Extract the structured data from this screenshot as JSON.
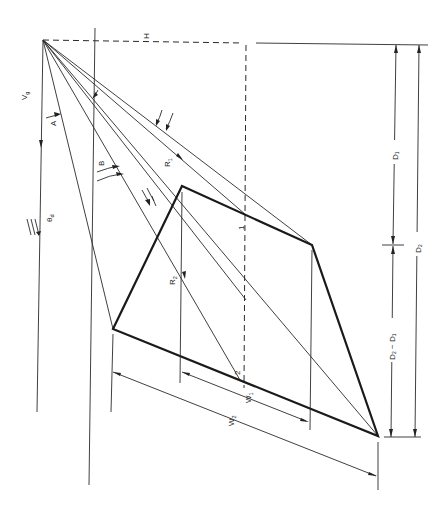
{
  "figure": {
    "orientation": "rotated 90 degrees clockwise",
    "labels": {
      "H": "H",
      "Vg_main": "V",
      "Vg_sub": "g",
      "A": "A",
      "B": "B",
      "theta_main": "θ",
      "theta_sub": "d",
      "R1_main": "R",
      "R1_sub": "1",
      "R2_main": "R",
      "R2_sub": "2",
      "point1": "1",
      "point2": "2",
      "W1_main": "W",
      "W1_sub": "1",
      "W2_main": "W",
      "W2_sub": "2",
      "D1": "D₁",
      "D2": "D₂",
      "D2_minus_D1": "D₂ − D₁"
    },
    "dimensions": [
      {
        "name": "D1",
        "label": "D₁",
        "from": "horizon-line",
        "to": "mid-tick"
      },
      {
        "name": "D2-D1",
        "label": "D₂ − D₁",
        "from": "mid-tick",
        "to": "bottom-line"
      },
      {
        "name": "D2",
        "label": "D₂",
        "from": "horizon-line",
        "to": "bottom-line"
      },
      {
        "name": "W1",
        "label": "W₁"
      },
      {
        "name": "W2",
        "label": "W₂"
      }
    ],
    "colors": {
      "line": "#222222",
      "background": "#ffffff"
    }
  }
}
